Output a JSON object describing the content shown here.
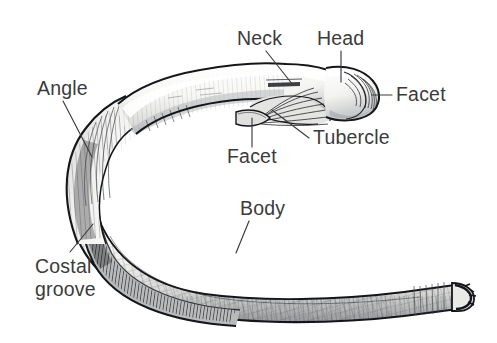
{
  "figure": {
    "background_color": "#ffffff",
    "ink_color": "#15161a",
    "label_color": "#3b3b3b",
    "bone_fill_color": "#f2f2f0",
    "shadow_color": "#8d8f93",
    "width": 497,
    "height": 343
  },
  "labels": [
    {
      "id": "neck",
      "text": "Neck",
      "x": 237,
      "y": 45,
      "anchor": "start",
      "leader": {
        "x1": 266,
        "y1": 51,
        "x2": 293,
        "y2": 85
      }
    },
    {
      "id": "head",
      "text": "Head",
      "x": 317,
      "y": 45,
      "anchor": "start",
      "leader": {
        "x1": 341,
        "y1": 51,
        "x2": 341,
        "y2": 82
      }
    },
    {
      "id": "facet-head",
      "text": "Facet",
      "x": 396,
      "y": 101,
      "anchor": "start",
      "leader": {
        "x1": 392,
        "y1": 95,
        "x2": 372,
        "y2": 95
      }
    },
    {
      "id": "tubercle",
      "text": "Tubercle",
      "x": 313,
      "y": 144,
      "anchor": "start",
      "leader": {
        "x1": 309,
        "y1": 138,
        "x2": 272,
        "y2": 110
      }
    },
    {
      "id": "facet-tubercle",
      "text": "Facet",
      "x": 227,
      "y": 163,
      "anchor": "start",
      "leader": {
        "x1": 252,
        "y1": 147,
        "x2": 252,
        "y2": 118
      }
    },
    {
      "id": "angle",
      "text": "Angle",
      "x": 37,
      "y": 95,
      "anchor": "start",
      "leader": {
        "x1": 63,
        "y1": 101,
        "x2": 92,
        "y2": 157
      }
    },
    {
      "id": "body",
      "text": "Body",
      "x": 240,
      "y": 215,
      "anchor": "start",
      "leader": {
        "x1": 249,
        "y1": 221,
        "x2": 236,
        "y2": 253
      }
    },
    {
      "id": "costal-groove-line1",
      "text": "Costal",
      "x": 35,
      "y": 273,
      "anchor": "start",
      "leader": {
        "x1": 70,
        "y1": 252,
        "x2": 93,
        "y2": 224
      }
    },
    {
      "id": "costal-groove-line2",
      "text": "groove",
      "x": 35,
      "y": 296,
      "anchor": "start",
      "leader": null
    }
  ],
  "parts": [
    {
      "id": "head",
      "name": "Head"
    },
    {
      "id": "neck",
      "name": "Neck"
    },
    {
      "id": "tubercle",
      "name": "Tubercle"
    },
    {
      "id": "facet-head",
      "name": "Facet"
    },
    {
      "id": "facet-tubercle",
      "name": "Facet"
    },
    {
      "id": "angle",
      "name": "Angle"
    },
    {
      "id": "body",
      "name": "Body"
    },
    {
      "id": "costal-groove",
      "name": "Costal groove"
    }
  ]
}
